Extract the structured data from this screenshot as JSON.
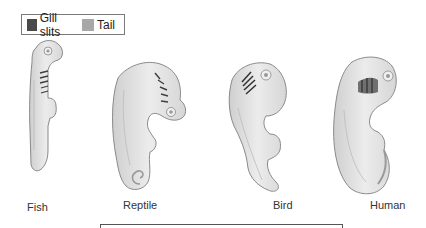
{
  "legend": {
    "items": [
      {
        "label": "Gill slits",
        "color": "#4a4a4a"
      },
      {
        "label": "Tail",
        "color": "#a8a8a8"
      }
    ]
  },
  "embryos": [
    {
      "name": "Fish"
    },
    {
      "name": "Reptile"
    },
    {
      "name": "Bird"
    },
    {
      "name": "Human"
    }
  ],
  "colors": {
    "body_fill": "#e4e4e4",
    "body_outline": "#8a8a8a",
    "gill": "#4a4a4a",
    "tail": "#a8a8a8"
  }
}
